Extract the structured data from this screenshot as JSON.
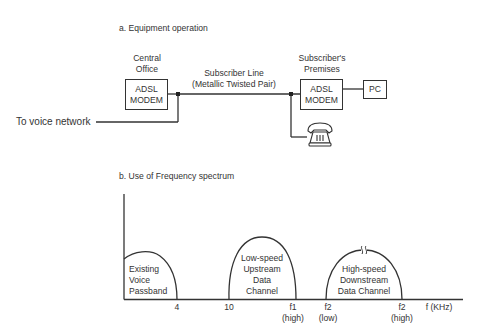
{
  "section_a": {
    "title": "a. Equipment operation",
    "central_office": {
      "label_line1": "Central",
      "label_line2": "Office",
      "box_line1": "ADSL",
      "box_line2": "MODEM"
    },
    "subscriber_line": {
      "label_line1": "Subscriber Line",
      "label_line2": "(Metallic Twisted Pair)"
    },
    "subscriber_premises": {
      "label_line1": "Subscriber's",
      "label_line2": "Premises",
      "box_line1": "ADSL",
      "box_line2": "MODEM"
    },
    "pc_label": "PC",
    "voice_network_label": "To voice network",
    "telephone_icon": "telephone-icon"
  },
  "section_b": {
    "title": "b. Use of Frequency spectrum",
    "bands": [
      {
        "line1": "Existing",
        "line2": "Voice",
        "line3": "Passband"
      },
      {
        "line1": "Low-speed",
        "line2": "Upstream",
        "line3": "Data",
        "line4": "Channel"
      },
      {
        "line1": "High-speed",
        "line2": "Downstream",
        "line3": "Data Channel"
      }
    ],
    "ticks": [
      {
        "line1": "4",
        "line2": ""
      },
      {
        "line1": "10",
        "line2": ""
      },
      {
        "line1": "f1",
        "line2": "(high)"
      },
      {
        "line1": "f2",
        "line2": "(low)"
      },
      {
        "line1": "f2",
        "line2": "(high)"
      }
    ],
    "axis_label": "f (KHz)"
  },
  "colors": {
    "stroke": "#333333",
    "text": "#333333",
    "background": "#ffffff"
  }
}
